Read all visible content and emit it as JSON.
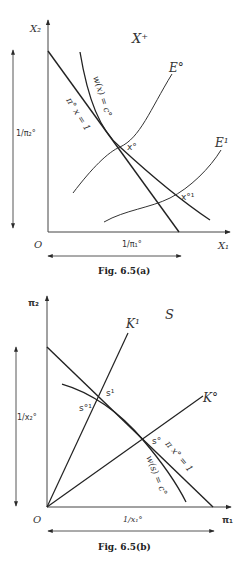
{
  "figure_a": {
    "caption": "Fig. 6.5(a)",
    "region_label": "X⁺",
    "y_axis_label": "X₂",
    "x_axis_label": "X₁",
    "origin_label": "O",
    "left_interval_label": "1/π₂°",
    "bottom_interval_label": "1/π₁°",
    "budget_line_label": "π° x = 1",
    "indifference_curve_label": "w(x) = c°",
    "curve_e0_label": "E°",
    "curve_e1_label": "E¹",
    "point_x0_label": "x°",
    "point_x01_label": "x°¹"
  },
  "figure_b": {
    "caption": "Fig. 6.5(b)",
    "region_label": "S",
    "y_axis_label": "π₂",
    "x_axis_label": "π₁",
    "origin_label": "O",
    "left_interval_label": "1/x₂°",
    "bottom_interval_label": "1/x₁°",
    "budget_line_label": "π x° = 1",
    "indifference_curve_label": "w(s) = c°",
    "ray_k1_label": "K¹",
    "ray_k0_label": "K°",
    "point_s0_label": "s°",
    "point_s1_label": "s¹",
    "point_s01_label": "s°¹"
  },
  "colors": {
    "line": "#2a2a2a",
    "background": "#ffffff"
  }
}
